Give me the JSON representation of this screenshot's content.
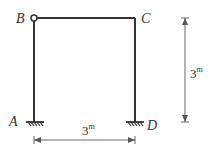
{
  "diagram": {
    "type": "portal-frame",
    "colors": {
      "member": "#333333",
      "dimension": "#666666",
      "background": "#ffffff"
    },
    "nodes": {
      "A": {
        "label": "A",
        "support": "fixed"
      },
      "B": {
        "label": "B",
        "connection": "hinge"
      },
      "C": {
        "label": "C",
        "connection": "rigid"
      },
      "D": {
        "label": "D",
        "support": "fixed"
      }
    },
    "dimensions": {
      "height": {
        "value": "3",
        "unit": "m"
      },
      "width": {
        "value": "3",
        "unit": "m"
      }
    }
  }
}
